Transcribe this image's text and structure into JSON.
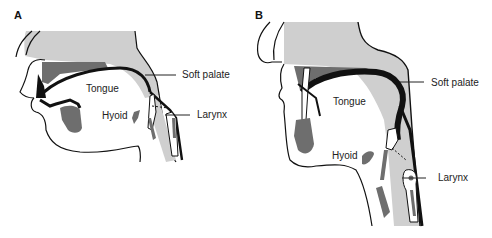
{
  "figure": {
    "panels": [
      {
        "letter": "A",
        "labels": {
          "soft_palate": "Soft palate",
          "tongue": "Tongue",
          "hyoid": "Hyoid",
          "larynx": "Larynx"
        }
      },
      {
        "letter": "B",
        "labels": {
          "soft_palate": "Soft palate",
          "tongue": "Tongue",
          "hyoid": "Hyoid",
          "larynx": "Larynx"
        }
      }
    ],
    "colors": {
      "light_tissue": "#cfcfcf",
      "dark_tissue": "#6e6e6e",
      "outline": "#111111",
      "background": "#ffffff"
    }
  }
}
